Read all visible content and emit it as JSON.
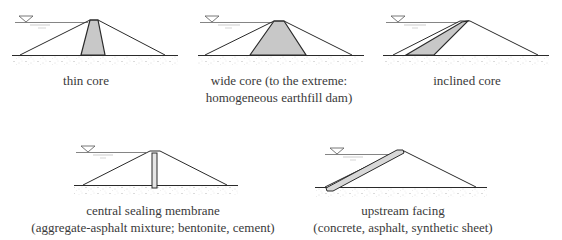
{
  "figure": {
    "colors": {
      "line": "#2a2a2a",
      "core_fill": "#c8c8c8",
      "ground_speckle": "#9a9a9a",
      "water_line": "#6a6a6a",
      "text": "#3a3a3a"
    },
    "panels": [
      {
        "id": "thin-core",
        "caption": [
          "thin core"
        ]
      },
      {
        "id": "wide-core",
        "caption": [
          "wide core (to the extreme:",
          "homogeneous earthfill dam)"
        ]
      },
      {
        "id": "inclined-core",
        "caption": [
          "inclined core"
        ]
      },
      {
        "id": "central-sealing-membrane",
        "caption": [
          "central sealing membrane",
          "(aggregate-asphalt mixture; bentonite, cement)"
        ]
      },
      {
        "id": "upstream-facing",
        "caption": [
          "upstream facing",
          "(concrete, asphalt, synthetic sheet)"
        ]
      }
    ],
    "water_level_symbol": "inverted-triangle"
  }
}
